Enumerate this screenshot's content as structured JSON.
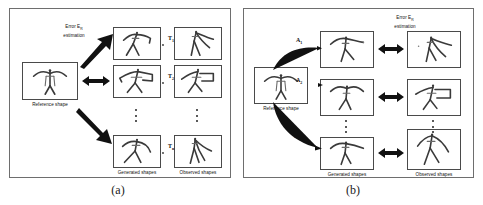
{
  "figure": {
    "caption_a": "(a)",
    "caption_b": "(b)"
  },
  "panel_a": {
    "error_label_line1": "Error E",
    "error_label_sub": "R",
    "error_label_line2": "estimation",
    "reference_label": "Reference shape",
    "generated_label": "Generated shapes",
    "observed_label": "Observed shapes",
    "transforms": [
      {
        "base": "T",
        "sub": "1"
      },
      {
        "base": "T",
        "sub": "2"
      },
      {
        "base": "T",
        "sub": "n"
      }
    ],
    "ellipsis": "⋮"
  },
  "panel_b": {
    "error_label_line1": "Error E",
    "error_label_sub": "R",
    "error_label_line2": "estimation",
    "reference_label": "Reference shape",
    "generated_label": "Generated shapes",
    "observed_label": "Observed shapes",
    "transforms": [
      {
        "base": "A",
        "sub": "1"
      },
      {
        "base": "A",
        "sub": "2"
      },
      {
        "base": "A",
        "sub": "n"
      }
    ],
    "ellipsis": "⋮"
  },
  "colors": {
    "panel_border": "#6e6e6e",
    "box_border": "#4a4a4a",
    "stroke": "#3a3a3a",
    "arrow": "#111111",
    "background": "#ffffff"
  }
}
